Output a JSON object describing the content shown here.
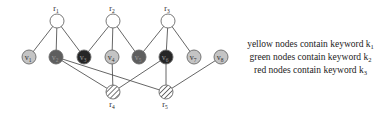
{
  "diagram": {
    "nodes": [
      {
        "id": "r1",
        "label": "r",
        "sub": "1",
        "x": 57,
        "y": 21,
        "type": "root-white",
        "label_pos": "above"
      },
      {
        "id": "r2",
        "label": "r",
        "sub": "2",
        "x": 113,
        "y": 21,
        "type": "root-white",
        "label_pos": "above"
      },
      {
        "id": "r3",
        "label": "r",
        "sub": "3",
        "x": 168,
        "y": 21,
        "type": "root-white",
        "label_pos": "above"
      },
      {
        "id": "v1",
        "label": "v",
        "sub": "1",
        "x": 29,
        "y": 57,
        "type": "yellow"
      },
      {
        "id": "v2",
        "label": "v",
        "sub": "2",
        "x": 56,
        "y": 57,
        "type": "green"
      },
      {
        "id": "v3",
        "label": "v",
        "sub": "3",
        "x": 84,
        "y": 57,
        "type": "red"
      },
      {
        "id": "v4",
        "label": "v",
        "sub": "4",
        "x": 112,
        "y": 57,
        "type": "yellow"
      },
      {
        "id": "v5",
        "label": "v",
        "sub": "5",
        "x": 139,
        "y": 57,
        "type": "green"
      },
      {
        "id": "v6",
        "label": "v",
        "sub": "6",
        "x": 166,
        "y": 57,
        "type": "red"
      },
      {
        "id": "v7",
        "label": "v",
        "sub": "7",
        "x": 194,
        "y": 57,
        "type": "yellow"
      },
      {
        "id": "v8",
        "label": "v",
        "sub": "8",
        "x": 221,
        "y": 57,
        "type": "yellow"
      },
      {
        "id": "r4",
        "label": "r",
        "sub": "4",
        "x": 113,
        "y": 92,
        "type": "root-hatched",
        "label_pos": "below"
      },
      {
        "id": "r5",
        "label": "r",
        "sub": "5",
        "x": 166,
        "y": 92,
        "type": "root-hatched",
        "label_pos": "below"
      }
    ],
    "edges": [
      [
        "r1",
        "v1"
      ],
      [
        "r1",
        "v2"
      ],
      [
        "r1",
        "v3"
      ],
      [
        "r2",
        "v3"
      ],
      [
        "r2",
        "v4"
      ],
      [
        "r2",
        "v5"
      ],
      [
        "r3",
        "v5"
      ],
      [
        "r3",
        "v6"
      ],
      [
        "r3",
        "v7"
      ],
      [
        "v2",
        "r4"
      ],
      [
        "v2",
        "r5"
      ],
      [
        "v4",
        "r4"
      ],
      [
        "v6",
        "r4"
      ],
      [
        "v6",
        "r5"
      ],
      [
        "v8",
        "r5"
      ]
    ],
    "colors": {
      "yellow": "#c4c4c4",
      "green": "#5e5e5e",
      "red": "#262626",
      "root-white": "#ffffff",
      "edge": "#555555",
      "stroke": "#6a6a6a"
    }
  },
  "legend": [
    {
      "text": "yellow nodes contain keyword k",
      "sub": "1"
    },
    {
      "text": "green nodes contain keyword k",
      "sub": "2"
    },
    {
      "text": "red nodes contain keyword k",
      "sub": "3"
    }
  ]
}
